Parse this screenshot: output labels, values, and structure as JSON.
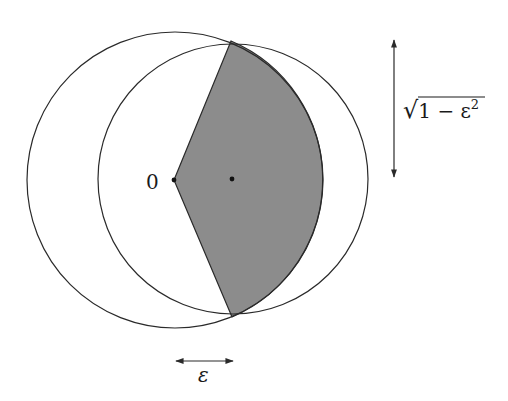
{
  "diagram": {
    "labels": {
      "origin": "0",
      "sqrt_prefix": "√",
      "sqrt_body": "1 − ε",
      "sqrt_exp": "2",
      "epsilon": "ε"
    },
    "colors": {
      "stroke": "#2a2a2a",
      "shade": "#8c8c8c",
      "background": "#ffffff"
    },
    "circles": [
      {
        "name": "unit-circle-at-origin",
        "cx": 174,
        "cy": 180,
        "r": 150
      },
      {
        "name": "shifted-circle",
        "cx": 232,
        "cy": 179,
        "r": 136
      }
    ],
    "points": {
      "origin": {
        "x": 174,
        "y": 180
      },
      "center": {
        "x": 232,
        "y": 179
      },
      "top_intersection": {
        "x": 231,
        "y": 41
      },
      "bottom_intersection": {
        "x": 232,
        "y": 317
      }
    }
  }
}
